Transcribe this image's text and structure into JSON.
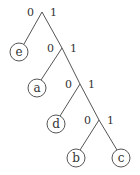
{
  "diagram": {
    "type": "binary-code-tree",
    "edges": [
      {
        "label": "0"
      },
      {
        "label": "1"
      },
      {
        "label": "0"
      },
      {
        "label": "1"
      },
      {
        "label": "0"
      },
      {
        "label": "1"
      },
      {
        "label": "0"
      },
      {
        "label": "1"
      }
    ],
    "leaves": [
      {
        "label": "e",
        "code": "0"
      },
      {
        "label": "a",
        "code": "10"
      },
      {
        "label": "d",
        "code": "110"
      },
      {
        "label": "b",
        "code": "1110"
      },
      {
        "label": "c",
        "code": "1111"
      }
    ]
  }
}
